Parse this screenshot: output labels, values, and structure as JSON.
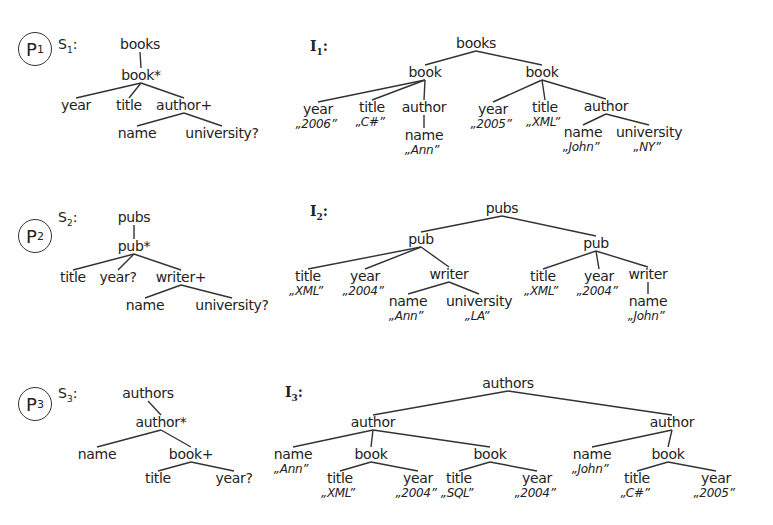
{
  "panels": [
    {
      "problem": {
        "prefix": "P",
        "index": "1",
        "x": 18,
        "y": 32
      },
      "schema": {
        "label": {
          "prefix": "S",
          "index": "1",
          "suffix": ":",
          "x": 58,
          "y": 36
        },
        "nodes": [
          {
            "id": "books",
            "text": "books",
            "x": 140,
            "y": 36
          },
          {
            "id": "book",
            "text": "book*",
            "x": 141,
            "y": 67
          },
          {
            "id": "year",
            "text": "year",
            "x": 76,
            "y": 97
          },
          {
            "id": "title",
            "text": "title",
            "x": 129,
            "y": 97
          },
          {
            "id": "author",
            "text": "author+",
            "x": 184,
            "y": 97
          },
          {
            "id": "name",
            "text": "name",
            "x": 137,
            "y": 125
          },
          {
            "id": "university",
            "text": "university?",
            "x": 222,
            "y": 125
          }
        ],
        "edges": [
          [
            "books",
            "book"
          ],
          [
            "book",
            "year"
          ],
          [
            "book",
            "title"
          ],
          [
            "book",
            "author"
          ],
          [
            "author",
            "name"
          ],
          [
            "author",
            "university"
          ]
        ]
      },
      "instance": {
        "label": {
          "prefix": "I",
          "index": "1",
          "suffix": ":",
          "x": 310,
          "y": 38
        },
        "nodes": [
          {
            "id": "books",
            "text": "books",
            "x": 476,
            "y": 35
          },
          {
            "id": "b1",
            "text": "book",
            "x": 425,
            "y": 64
          },
          {
            "id": "b2",
            "text": "book",
            "x": 542,
            "y": 64
          },
          {
            "id": "y1",
            "text": "year",
            "x": 318,
            "y": 101,
            "value": "„2006”"
          },
          {
            "id": "t1",
            "text": "title",
            "x": 372,
            "y": 99,
            "value": "„C#”"
          },
          {
            "id": "a1",
            "text": "author",
            "x": 424,
            "y": 99
          },
          {
            "id": "n1",
            "text": "name",
            "x": 424,
            "y": 127,
            "value": "„Ann”"
          },
          {
            "id": "y2",
            "text": "year",
            "x": 493,
            "y": 101,
            "value": "„2005”"
          },
          {
            "id": "t2",
            "text": "title",
            "x": 545,
            "y": 99,
            "value": "„XML”"
          },
          {
            "id": "a2",
            "text": "author",
            "x": 606,
            "y": 98
          },
          {
            "id": "n2",
            "text": "name",
            "x": 583,
            "y": 124,
            "value": "„John”"
          },
          {
            "id": "u2",
            "text": "university",
            "x": 649,
            "y": 124,
            "value": "„NY”"
          }
        ],
        "edges": [
          [
            "books",
            "b1"
          ],
          [
            "books",
            "b2"
          ],
          [
            "b1",
            "y1"
          ],
          [
            "b1",
            "t1"
          ],
          [
            "b1",
            "a1"
          ],
          [
            "a1",
            "n1"
          ],
          [
            "b2",
            "y2"
          ],
          [
            "b2",
            "t2"
          ],
          [
            "b2",
            "a2"
          ],
          [
            "a2",
            "n2"
          ],
          [
            "a2",
            "u2"
          ]
        ]
      }
    },
    {
      "problem": {
        "prefix": "P",
        "index": "2",
        "x": 18,
        "y": 219
      },
      "schema": {
        "label": {
          "prefix": "S",
          "index": "2",
          "suffix": ":",
          "x": 58,
          "y": 209
        },
        "nodes": [
          {
            "id": "pubs",
            "text": "pubs",
            "x": 134,
            "y": 209
          },
          {
            "id": "pub",
            "text": "pub*",
            "x": 134,
            "y": 238
          },
          {
            "id": "title",
            "text": "title",
            "x": 73,
            "y": 269
          },
          {
            "id": "year",
            "text": "year?",
            "x": 118,
            "y": 269
          },
          {
            "id": "writer",
            "text": "writer+",
            "x": 181,
            "y": 269
          },
          {
            "id": "name",
            "text": "name",
            "x": 145,
            "y": 297
          },
          {
            "id": "university",
            "text": "university?",
            "x": 232,
            "y": 297
          }
        ],
        "edges": [
          [
            "pubs",
            "pub"
          ],
          [
            "pub",
            "title"
          ],
          [
            "pub",
            "year"
          ],
          [
            "pub",
            "writer"
          ],
          [
            "writer",
            "name"
          ],
          [
            "writer",
            "university"
          ]
        ]
      },
      "instance": {
        "label": {
          "prefix": "I",
          "index": "2",
          "suffix": ":",
          "x": 310,
          "y": 203
        },
        "nodes": [
          {
            "id": "pubs",
            "text": "pubs",
            "x": 502,
            "y": 200
          },
          {
            "id": "p1",
            "text": "pub",
            "x": 421,
            "y": 231
          },
          {
            "id": "p2",
            "text": "pub",
            "x": 596,
            "y": 235
          },
          {
            "id": "t1",
            "text": "title",
            "x": 308,
            "y": 268,
            "value": "„XML”"
          },
          {
            "id": "y1",
            "text": "year",
            "x": 365,
            "y": 268,
            "value": "„2004”"
          },
          {
            "id": "w1",
            "text": "writer",
            "x": 449,
            "y": 266
          },
          {
            "id": "n1",
            "text": "name",
            "x": 408,
            "y": 293,
            "value": "„Ann”"
          },
          {
            "id": "u1",
            "text": "university",
            "x": 479,
            "y": 293,
            "value": "„LA”"
          },
          {
            "id": "t2",
            "text": "title",
            "x": 543,
            "y": 268,
            "value": "„XML”"
          },
          {
            "id": "y2",
            "text": "year",
            "x": 599,
            "y": 268,
            "value": "„2004”"
          },
          {
            "id": "w2",
            "text": "writer",
            "x": 648,
            "y": 266
          },
          {
            "id": "n2",
            "text": "name",
            "x": 648,
            "y": 293,
            "value": "„John”"
          }
        ],
        "edges": [
          [
            "pubs",
            "p1"
          ],
          [
            "pubs",
            "p2"
          ],
          [
            "p1",
            "t1"
          ],
          [
            "p1",
            "y1"
          ],
          [
            "p1",
            "w1"
          ],
          [
            "w1",
            "n1"
          ],
          [
            "w1",
            "u1"
          ],
          [
            "p2",
            "t2"
          ],
          [
            "p2",
            "y2"
          ],
          [
            "p2",
            "w2"
          ],
          [
            "w2",
            "n2"
          ]
        ]
      }
    },
    {
      "problem": {
        "prefix": "P",
        "index": "3",
        "x": 18,
        "y": 387
      },
      "schema": {
        "label": {
          "prefix": "S",
          "index": "3",
          "suffix": ":",
          "x": 58,
          "y": 385
        },
        "nodes": [
          {
            "id": "authors",
            "text": "authors",
            "x": 148,
            "y": 385
          },
          {
            "id": "author",
            "text": "author*",
            "x": 161,
            "y": 414
          },
          {
            "id": "name",
            "text": "name",
            "x": 97,
            "y": 446
          },
          {
            "id": "book",
            "text": "book+",
            "x": 191,
            "y": 446
          },
          {
            "id": "title",
            "text": "title",
            "x": 158,
            "y": 470
          },
          {
            "id": "year",
            "text": "year?",
            "x": 234,
            "y": 470
          }
        ],
        "edges": [
          [
            "authors",
            "author"
          ],
          [
            "author",
            "name"
          ],
          [
            "author",
            "book"
          ],
          [
            "book",
            "title"
          ],
          [
            "book",
            "year"
          ]
        ]
      },
      "instance": {
        "label": {
          "prefix": "I",
          "index": "3",
          "suffix": ":",
          "x": 285,
          "y": 384
        },
        "nodes": [
          {
            "id": "authors",
            "text": "authors",
            "x": 508,
            "y": 375
          },
          {
            "id": "a1",
            "text": "author",
            "x": 373,
            "y": 414
          },
          {
            "id": "a2",
            "text": "author",
            "x": 672,
            "y": 414
          },
          {
            "id": "n1",
            "text": "name",
            "x": 293,
            "y": 446,
            "value": "„Ann”"
          },
          {
            "id": "b1",
            "text": "book",
            "x": 371,
            "y": 446
          },
          {
            "id": "t1",
            "text": "title",
            "x": 340,
            "y": 470,
            "value": "„XML”"
          },
          {
            "id": "y1",
            "text": "year",
            "x": 418,
            "y": 470,
            "value": "„2004”"
          },
          {
            "id": "b2",
            "text": "book",
            "x": 490,
            "y": 446
          },
          {
            "id": "t2",
            "text": "title",
            "x": 459,
            "y": 470,
            "value": "„SQL”"
          },
          {
            "id": "y2",
            "text": "year",
            "x": 537,
            "y": 470,
            "value": "„2004”"
          },
          {
            "id": "n2",
            "text": "name",
            "x": 592,
            "y": 446,
            "value": "„John”"
          },
          {
            "id": "b3",
            "text": "book",
            "x": 668,
            "y": 446
          },
          {
            "id": "t3",
            "text": "title",
            "x": 637,
            "y": 470,
            "value": "„C#”"
          },
          {
            "id": "y3",
            "text": "year",
            "x": 716,
            "y": 470,
            "value": "„2005”"
          }
        ],
        "edges": [
          [
            "authors",
            "a1"
          ],
          [
            "authors",
            "a2"
          ],
          [
            "a1",
            "n1"
          ],
          [
            "a1",
            "b1"
          ],
          [
            "a1",
            "b2"
          ],
          [
            "b1",
            "t1"
          ],
          [
            "b1",
            "y1"
          ],
          [
            "b2",
            "t2"
          ],
          [
            "b2",
            "y2"
          ],
          [
            "a2",
            "n2"
          ],
          [
            "a2",
            "b3"
          ],
          [
            "b3",
            "t3"
          ],
          [
            "b3",
            "y3"
          ]
        ]
      }
    }
  ]
}
